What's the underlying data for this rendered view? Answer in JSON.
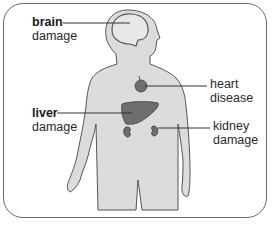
{
  "diagram": {
    "colors": {
      "body_fill": "#dcdcdc",
      "body_outline": "#555555",
      "organ_fill": "#6e6e6e",
      "frame_border": "#6a6a6a",
      "leader_line": "#333333"
    },
    "labels": [
      {
        "id": "brain",
        "line1": "brain",
        "line1_bold": true,
        "line2": "damage"
      },
      {
        "id": "heart",
        "line1": "heart",
        "line1_bold": false,
        "line2": "disease"
      },
      {
        "id": "liver",
        "line1": "liver",
        "line1_bold": true,
        "line2": "damage"
      },
      {
        "id": "kidney",
        "line1": "kidney",
        "line1_bold": false,
        "line2": "damage"
      }
    ]
  }
}
